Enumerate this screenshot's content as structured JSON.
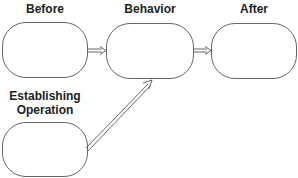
{
  "diagram": {
    "nodes": [
      {
        "id": "before",
        "label": "Before"
      },
      {
        "id": "behavior",
        "label": "Behavior"
      },
      {
        "id": "after",
        "label": "After"
      },
      {
        "id": "establishing",
        "label": "Establishing Operation",
        "label_lines": [
          "Establishing",
          "Operation"
        ]
      }
    ],
    "edges": [
      {
        "from": "before",
        "to": "behavior",
        "style": "double-line arrow"
      },
      {
        "from": "behavior",
        "to": "after",
        "style": "double-line arrow"
      },
      {
        "from": "establishing",
        "to": "behavior",
        "style": "double-line arrow"
      }
    ],
    "colors": {
      "stroke": "#666666",
      "text": "#222222",
      "background": "#ffffff"
    }
  }
}
